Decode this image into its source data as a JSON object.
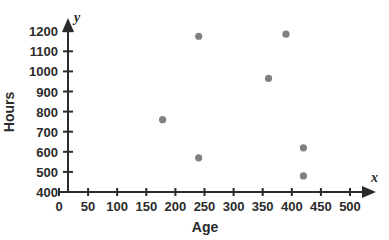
{
  "chart_data": {
    "type": "scatter",
    "title": "",
    "xlabel": "Age",
    "ylabel": "Hours",
    "x_axis_variable": "x",
    "y_axis_variable": "y",
    "xlim": [
      0,
      530
    ],
    "ylim": [
      400,
      1240
    ],
    "x_ticks": [
      0,
      50,
      100,
      150,
      200,
      250,
      300,
      350,
      400,
      450,
      500
    ],
    "y_ticks": [
      400,
      500,
      600,
      700,
      800,
      900,
      1000,
      1100,
      1200
    ],
    "grid": false,
    "legend": false,
    "marker_color": "#808080",
    "axis_color": "#2b2b2b",
    "points": [
      {
        "x": 178,
        "y": 760
      },
      {
        "x": 240,
        "y": 1175
      },
      {
        "x": 240,
        "y": 570
      },
      {
        "x": 360,
        "y": 965
      },
      {
        "x": 390,
        "y": 1185
      },
      {
        "x": 420,
        "y": 620
      },
      {
        "x": 420,
        "y": 480
      }
    ]
  }
}
